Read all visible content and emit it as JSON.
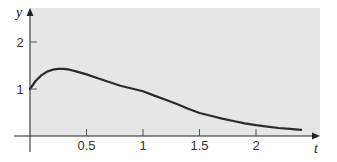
{
  "chart_data": {
    "type": "line",
    "title": "",
    "xlabel": "t",
    "ylabel": "y",
    "xlim": [
      0,
      2.55
    ],
    "ylim": [
      0,
      2.7
    ],
    "grid": false,
    "legend": null,
    "x_ticks": [
      0.5,
      1,
      1.5,
      2
    ],
    "x_tick_labels": [
      "0.5",
      "1",
      "1.5",
      "2"
    ],
    "y_ticks": [
      1,
      2
    ],
    "y_tick_labels": [
      "1",
      "2"
    ],
    "series": [
      {
        "name": "y(t)",
        "x": [
          0,
          0.05,
          0.1,
          0.15,
          0.2,
          0.25,
          0.3,
          0.35,
          0.4,
          0.5,
          0.6,
          0.7,
          0.8,
          0.9,
          1.0,
          1.1,
          1.2,
          1.3,
          1.4,
          1.5,
          1.6,
          1.7,
          1.8,
          1.9,
          2.0,
          2.1,
          2.2,
          2.3,
          2.4
        ],
        "values": [
          1.0,
          1.17,
          1.29,
          1.37,
          1.41,
          1.43,
          1.43,
          1.41,
          1.38,
          1.31,
          1.23,
          1.15,
          1.07,
          1.01,
          0.95,
          0.86,
          0.77,
          0.68,
          0.58,
          0.49,
          0.43,
          0.37,
          0.32,
          0.27,
          0.23,
          0.2,
          0.17,
          0.15,
          0.13
        ]
      }
    ],
    "colors": {
      "plot_background": "#e6e6e6",
      "curve": "#2b2b2b",
      "axis": "#222222"
    }
  },
  "labels": {
    "x_axis": "t",
    "y_axis": "y",
    "x_ticks": [
      "0.5",
      "1",
      "1.5",
      "2"
    ],
    "y_ticks": [
      "1",
      "2"
    ]
  }
}
